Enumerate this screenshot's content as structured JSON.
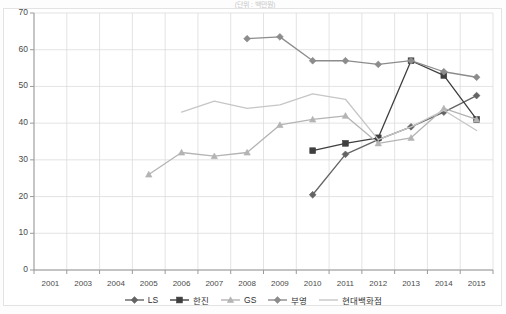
{
  "top_title": "(단위 : 백만원)",
  "chart_data": {
    "type": "line",
    "title": "",
    "subtitle": "",
    "xlabel": "",
    "ylabel": "",
    "ylim": [
      0,
      70
    ],
    "ytick_step": 10,
    "yticks": [
      "70",
      "60",
      "50",
      "40",
      "30",
      "20",
      "10",
      "0"
    ],
    "grid": true,
    "legend_position": "bottom",
    "categories": [
      "2001",
      "2003",
      "2004",
      "2005",
      "2006",
      "2007",
      "2008",
      "2009",
      "2010",
      "2011",
      "2012",
      "2013",
      "2014",
      "2015"
    ],
    "x": [
      "2001",
      "2003",
      "2004",
      "2005",
      "2006",
      "2007",
      "2008",
      "2009",
      "2010",
      "2011",
      "2012",
      "2013",
      "2014",
      "2015"
    ],
    "series": [
      {
        "name": "LS",
        "marker": "diamond",
        "color": "#646464",
        "values": [
          null,
          null,
          null,
          null,
          null,
          null,
          null,
          null,
          20.5,
          31.5,
          35.5,
          39.0,
          43.0,
          47.5
        ]
      },
      {
        "name": "한진",
        "marker": "square",
        "color": "#3f3f3f",
        "values": [
          null,
          null,
          null,
          null,
          null,
          null,
          null,
          null,
          32.5,
          34.5,
          36.0,
          57.0,
          53.0,
          41.0
        ]
      },
      {
        "name": "GS",
        "marker": "triangle",
        "color": "#b4b4b4",
        "values": [
          null,
          null,
          null,
          26.0,
          32.0,
          31.0,
          32.0,
          39.5,
          41.0,
          42.0,
          34.5,
          36.0,
          44.0,
          41.0
        ]
      },
      {
        "name": "부영",
        "marker": "diamond",
        "color": "#8c8c8c",
        "values": [
          null,
          null,
          null,
          null,
          null,
          null,
          63.0,
          63.5,
          57.0,
          57.0,
          56.0,
          57.0,
          54.0,
          52.5
        ]
      },
      {
        "name": "현대백화점",
        "marker": "none",
        "color": "#c6c6c6",
        "values": [
          null,
          null,
          null,
          null,
          43.0,
          46.0,
          44.0,
          45.0,
          48.0,
          46.5,
          35.5,
          39.0,
          43.5,
          38.0
        ]
      }
    ]
  },
  "legend": {
    "items": [
      {
        "label": "LS",
        "marker": "diamond-icon",
        "color": "#646464"
      },
      {
        "label": "한진",
        "marker": "square-icon",
        "color": "#3f3f3f"
      },
      {
        "label": "GS",
        "marker": "triangle-icon",
        "color": "#b4b4b4"
      },
      {
        "label": "부영",
        "marker": "diamond-icon",
        "color": "#8c8c8c"
      },
      {
        "label": "현대백화점",
        "marker": "line-icon",
        "color": "#c6c6c6"
      }
    ]
  }
}
